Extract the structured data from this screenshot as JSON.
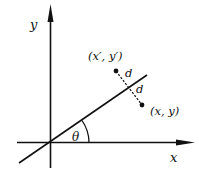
{
  "diagram": {
    "axes": {
      "x_label": "x",
      "y_label": "y"
    },
    "line": {
      "angle_label": "θ"
    },
    "points": {
      "reflected_label": "(x′, y′)",
      "original_label": "(x, y)"
    },
    "distances": {
      "upper_label": "d",
      "lower_label": "d"
    },
    "colors": {
      "stroke": "#111111",
      "background": "#ffffff"
    }
  }
}
